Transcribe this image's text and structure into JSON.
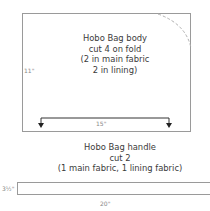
{
  "body_piece": {
    "title": "Hobo Bag body",
    "line2": "cut 4 on fold",
    "line3": "(2 in main fabric",
    "line4": "2 in lining)",
    "height_label": "11\"",
    "width_label": "15\""
  },
  "handle_piece": {
    "title": "Hobo Bag handle",
    "line2": "cut 2",
    "line3": "(1 main fabric, 1 lining fabric)",
    "height_label": "3½\"",
    "width_label": "20\""
  },
  "colors": {
    "outline": "#9a9a9a",
    "text": "#3a3a3a",
    "arrow": "#222222"
  }
}
